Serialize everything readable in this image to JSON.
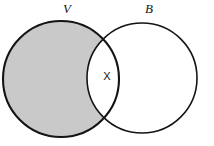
{
  "diagram": {
    "kind": "venn-diagram",
    "canvas": {
      "width": 214,
      "height": 146,
      "background": "#ffffff"
    },
    "colors": {
      "shading": "#c9c9c9",
      "stroke": "#141414",
      "unshaded": "#ffffff",
      "text": "#141414"
    },
    "sets": [
      {
        "id": "left",
        "label": "V",
        "label_x": 67,
        "label_y": 13,
        "cx": 61,
        "cy": 79,
        "r": 58,
        "fill": "#c9c9c9",
        "stroke_width": 2.1,
        "shaded": true
      },
      {
        "id": "right",
        "label": "B",
        "label_x": 149,
        "label_y": 13,
        "cx": 142,
        "cy": 78,
        "r": 55,
        "fill": "#ffffff",
        "stroke_width": 1.6,
        "shaded": false
      }
    ],
    "regions": [
      {
        "id": "intersection",
        "label": "X",
        "label_x": 107,
        "label_y": 80,
        "fill": "#ffffff",
        "shaded": false
      }
    ]
  }
}
